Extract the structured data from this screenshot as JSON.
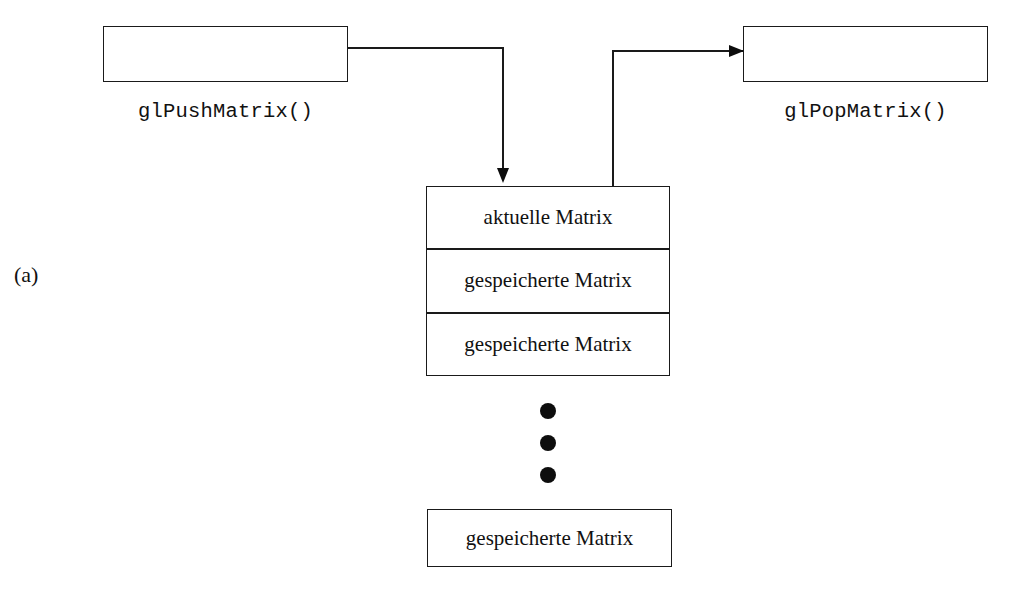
{
  "figure": {
    "label": "(a)",
    "caption_language": "de"
  },
  "push": {
    "box_label": "",
    "call_label": "glPushMatrix()"
  },
  "pop": {
    "box_label": "",
    "call_label": "glPopMatrix()"
  },
  "matrix_stack": {
    "cells": [
      {
        "text": "aktuelle Matrix"
      },
      {
        "text": "gespeicherte Matrix"
      },
      {
        "text": "gespeicherte Matrix"
      }
    ],
    "ellipsis": "•••",
    "bottom_cell": {
      "text": "gespeicherte Matrix"
    }
  },
  "colors": {
    "stroke": "#1a1a1a",
    "fill": "#ffffff",
    "dot": "#0d0d0d",
    "text": "#111111"
  }
}
